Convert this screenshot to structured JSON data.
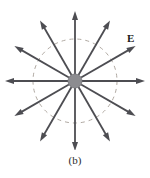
{
  "figure": {
    "caption": "(b)",
    "field_label": "E",
    "colors": {
      "arrow": "#4d4d52",
      "charge_fill": "#8c8c90",
      "charge_stroke": "#6e6e73",
      "dashed_circle": "#b0a9a2",
      "text": "#1f1f1f",
      "background": "#ffffff"
    },
    "geometry": {
      "center_x": 75,
      "center_y": 81,
      "charge_radius": 7,
      "dashed_circle_radius": 42,
      "arrow_count": 12,
      "arrow_angle_step_deg": 30,
      "arrow_inner_radius": 7,
      "arrow_outer_radius": 70,
      "arrow_head_length": 9,
      "arrow_head_width": 6,
      "dash_pattern": "4 4"
    },
    "arrows": [
      {
        "name": "arrow-0deg-right",
        "angle_deg": 0
      },
      {
        "name": "arrow-30deg",
        "angle_deg": 30
      },
      {
        "name": "arrow-60deg",
        "angle_deg": 60
      },
      {
        "name": "arrow-90deg-up",
        "angle_deg": 90
      },
      {
        "name": "arrow-120deg",
        "angle_deg": 120
      },
      {
        "name": "arrow-150deg",
        "angle_deg": 150
      },
      {
        "name": "arrow-180deg-left",
        "angle_deg": 180
      },
      {
        "name": "arrow-210deg",
        "angle_deg": 210
      },
      {
        "name": "arrow-240deg",
        "angle_deg": 240
      },
      {
        "name": "arrow-270deg-down",
        "angle_deg": 270
      },
      {
        "name": "arrow-300deg",
        "angle_deg": 300
      },
      {
        "name": "arrow-330deg",
        "angle_deg": 330
      }
    ]
  }
}
